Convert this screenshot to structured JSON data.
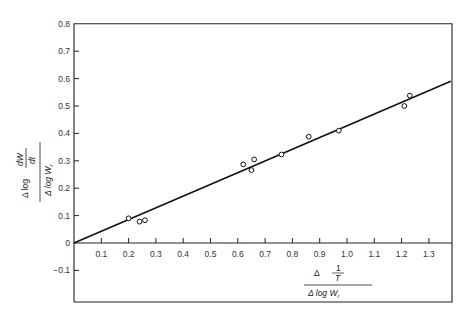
{
  "chart_data": {
    "type": "scatter",
    "title": "",
    "xlabel": "Δ(1/T) / Δ log W_r",
    "ylabel": "Δ log(dW/dt) / Δ log W_r",
    "xlim": [
      0,
      1.4
    ],
    "ylim": [
      -0.15,
      0.8
    ],
    "grid": false,
    "legend": null,
    "x_ticks": [
      "0.1",
      "0.2",
      "0.3",
      "0.4",
      "0.5",
      "0.6",
      "0.7",
      "0.8",
      "0.9",
      "1.0",
      "1.1",
      "1.2",
      "1.3"
    ],
    "y_ticks": [
      "-0.1",
      "0",
      "0.1",
      "0.2",
      "0.3",
      "0.4",
      "0.5",
      "0.6",
      "0.7",
      "0.8"
    ],
    "series": [
      {
        "name": "data points",
        "marker": "open-circle",
        "points": [
          {
            "x": 0.2,
            "y": 0.09
          },
          {
            "x": 0.24,
            "y": 0.078
          },
          {
            "x": 0.26,
            "y": 0.083
          },
          {
            "x": 0.62,
            "y": 0.287
          },
          {
            "x": 0.65,
            "y": 0.266
          },
          {
            "x": 0.66,
            "y": 0.305
          },
          {
            "x": 0.76,
            "y": 0.323
          },
          {
            "x": 0.86,
            "y": 0.388
          },
          {
            "x": 0.97,
            "y": 0.41
          },
          {
            "x": 1.21,
            "y": 0.5
          },
          {
            "x": 1.23,
            "y": 0.538
          }
        ]
      },
      {
        "name": "fitted line",
        "type": "line",
        "points": [
          {
            "x": 0.0,
            "y": 0.0
          },
          {
            "x": 1.38,
            "y": 0.59
          }
        ]
      }
    ]
  },
  "labels": {
    "y_num": "dW",
    "y_den": "dt",
    "y_delta_log": "Δ log",
    "y_bottom": "Δ log W",
    "y_bottom_sub": "r",
    "x_delta": "Δ",
    "x_num": "1",
    "x_den": "T",
    "x_bottom": "Δ log W",
    "x_bottom_sub": "r"
  }
}
